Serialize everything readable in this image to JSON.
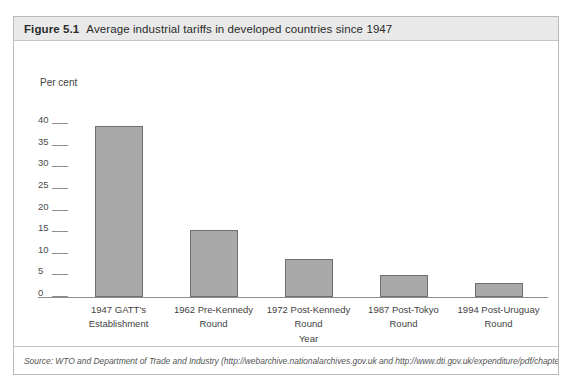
{
  "figure": {
    "number": "Figure 5.1",
    "title": "Average industrial tariffs in developed countries since 1947",
    "source": "Source: WTO and Department of Trade and Industry (http://webarchive.nationalarchives.gov.uk and http://www.dti.gov.uk/expenditure/pdf/chapter_8.pdf)."
  },
  "style": {
    "bar_fill": "#a9a9a9",
    "bar_border": "#6f6f6f",
    "header_band": "#e9e9e9",
    "frame_border": "#b9b9b9",
    "axis_line": "#8d8d8d"
  },
  "chart_data": {
    "type": "bar",
    "title": "Average industrial tariffs in developed countries since 1947",
    "xlabel": "Year",
    "ylabel": "Per cent",
    "ylim": [
      0,
      40
    ],
    "yticks": [
      0,
      5,
      10,
      15,
      20,
      25,
      30,
      35,
      40
    ],
    "ytick_labels": [
      "0",
      "5",
      "10",
      "15",
      "20",
      "25",
      "30",
      "35",
      "40"
    ],
    "grid": false,
    "legend": null,
    "categories": [
      "1947 GATT's Establishment",
      "1962 Pre-Kennedy Round",
      "1972 Post-Kennedy Round",
      "1987 Post-Tokyo Round",
      "1994 Post-Uruguay Round"
    ],
    "category_lines": [
      [
        "1947 GATT's",
        "Establishment"
      ],
      [
        "1962 Pre-Kennedy",
        "Round"
      ],
      [
        "1972 Post-Kennedy",
        "Round"
      ],
      [
        "1987 Post-Tokyo",
        "Round"
      ],
      [
        "1994 Post-Uruguay",
        "Round"
      ]
    ],
    "values": [
      39.5,
      15.4,
      8.7,
      5.2,
      3.3
    ]
  }
}
